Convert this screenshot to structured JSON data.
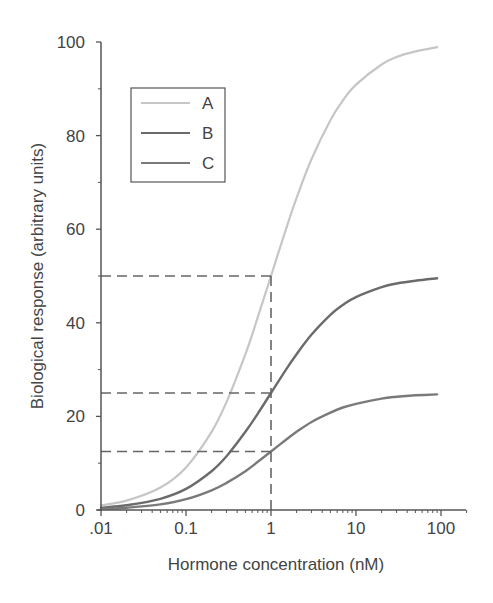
{
  "chart_data": {
    "type": "line",
    "title": "",
    "xlabel": "Hormone concentration (nM)",
    "ylabel": "Biological response (arbitrary units)",
    "xscale": "log",
    "xlim": [
      0.01,
      200
    ],
    "ylim": [
      0,
      100
    ],
    "x_ticks": [
      0.01,
      0.1,
      1,
      10,
      100
    ],
    "x_tick_labels": [
      ".01",
      "0.1",
      "1",
      "10",
      "100"
    ],
    "y_ticks": [
      0,
      20,
      40,
      60,
      80,
      100
    ],
    "y_tick_labels": [
      "0",
      "20",
      "40",
      "60",
      "80",
      "100"
    ],
    "grid": false,
    "legend_position": "upper left",
    "x": [
      0.01,
      0.02,
      0.05,
      0.1,
      0.2,
      0.3,
      0.5,
      0.7,
      1,
      1.5,
      2,
      3,
      5,
      7,
      10,
      20,
      30,
      50,
      90
    ],
    "series": [
      {
        "name": "A",
        "color": "#c6c6c6",
        "values": [
          1.0,
          2.0,
          4.8,
          9.1,
          16.7,
          23.1,
          33.3,
          41.2,
          50.0,
          60.0,
          66.7,
          75.0,
          83.3,
          87.5,
          90.9,
          95.2,
          96.8,
          98.0,
          98.9
        ]
      },
      {
        "name": "B",
        "color": "#6b6b6b",
        "values": [
          0.5,
          1.0,
          2.4,
          4.5,
          8.3,
          11.5,
          16.7,
          20.6,
          25.0,
          30.0,
          33.3,
          37.5,
          41.7,
          43.8,
          45.5,
          47.6,
          48.4,
          49.0,
          49.5
        ]
      },
      {
        "name": "C",
        "color": "#7a7a7a",
        "values": [
          0.25,
          0.5,
          1.2,
          2.3,
          4.2,
          5.8,
          8.3,
          10.3,
          12.5,
          15.0,
          16.7,
          18.8,
          20.8,
          21.9,
          22.7,
          23.8,
          24.2,
          24.5,
          24.7
        ]
      }
    ],
    "annotations": [
      {
        "type": "dashed-hline",
        "y": 50,
        "x_to": 1,
        "note": "half-max of A"
      },
      {
        "type": "dashed-hline",
        "y": 25,
        "x_to": 1,
        "note": "half-max of B"
      },
      {
        "type": "dashed-hline",
        "y": 12.5,
        "x_to": 1,
        "note": "half-max of C"
      },
      {
        "type": "dashed-vline",
        "x": 1,
        "y_to": 50,
        "note": "EC50 = 1 nM"
      }
    ]
  },
  "legend": {
    "items": [
      {
        "label": "A",
        "color": "#c6c6c6"
      },
      {
        "label": "B",
        "color": "#6b6b6b"
      },
      {
        "label": "C",
        "color": "#7a7a7a"
      }
    ]
  }
}
